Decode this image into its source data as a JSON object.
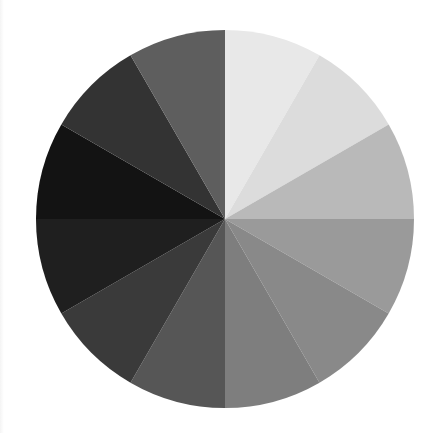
{
  "figure": {
    "title": "",
    "background_color": "#ffffff",
    "width": 441,
    "height": 433
  },
  "pie": {
    "center_x": 225,
    "center_y": 219,
    "radius": 189,
    "start_angle_deg": 90,
    "direction": "clockwise",
    "edge_color": "none",
    "label_text": ""
  },
  "chart_data": {
    "type": "pie",
    "title": "",
    "xlabel": "",
    "ylabel": "",
    "grid": false,
    "legend": "none",
    "categories": [
      "Wedge 1",
      "Wedge 2",
      "Wedge 3",
      "Wedge 4",
      "Wedge 5",
      "Wedge 6",
      "Wedge 7",
      "Wedge 8",
      "Wedge 9",
      "Wedge 10",
      "Wedge 11",
      "Wedge 12"
    ],
    "values": [
      1,
      1,
      1,
      1,
      1,
      1,
      1,
      1,
      1,
      1,
      1,
      1
    ],
    "percentages": [
      "8.33%",
      "8.33%",
      "8.33%",
      "8.33%",
      "8.33%",
      "8.33%",
      "8.33%",
      "8.33%",
      "8.33%",
      "8.33%",
      "8.33%",
      "8.33%"
    ],
    "slice_angle_deg": 30,
    "colors": [
      "#e8e8e8",
      "#dcdcdc",
      "#b9b9b9",
      "#9a9a9a",
      "#898989",
      "#7e7e7e",
      "#565656",
      "#3a3a3a",
      "#1f1f1f",
      "#131313",
      "#333333",
      "#464646"
    ],
    "colormap": "grayscale",
    "wedges": [
      {
        "name": "Wedge 1",
        "color": "#e8e8e8",
        "start_deg": 90,
        "end_deg": 60
      },
      {
        "name": "Wedge 2",
        "color": "#dcdcdc",
        "start_deg": 60,
        "end_deg": 30
      },
      {
        "name": "Wedge 3",
        "color": "#b9b9b9",
        "start_deg": 30,
        "end_deg": 0
      },
      {
        "name": "Wedge 4",
        "color": "#9a9a9a",
        "start_deg": 0,
        "end_deg": -30
      },
      {
        "name": "Wedge 5",
        "color": "#898989",
        "start_deg": -30,
        "end_deg": -60
      },
      {
        "name": "Wedge 6",
        "color": "#7e7e7e",
        "start_deg": -60,
        "end_deg": -90
      },
      {
        "name": "Wedge 7",
        "color": "#565656",
        "start_deg": -90,
        "end_deg": -120
      },
      {
        "name": "Wedge 8",
        "color": "#3a3a3a",
        "start_deg": -120,
        "end_deg": -150
      },
      {
        "name": "Wedge 9",
        "color": "#1f1f1f",
        "start_deg": -150,
        "end_deg": -180
      },
      {
        "name": "Wedge 10",
        "color": "#131313",
        "start_deg": -180,
        "end_deg": -210
      },
      {
        "name": "Wedge 11",
        "color": "#333333",
        "start_deg": -210,
        "end_deg": -240
      },
      {
        "name": "Wedge 12",
        "color": "#5e5e5e",
        "start_deg": -240,
        "end_deg": -270
      }
    ],
    "extra_wedge_shades": {
      "upper_left_mid": "#8f8f8f",
      "upper_left_light": "#b4b4b4"
    }
  }
}
